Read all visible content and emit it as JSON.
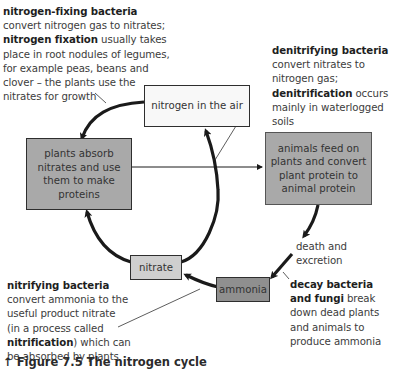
{
  "annotations": {
    "nitrogen_fixing": {
      "title": "nitrogen-fixing bacteria",
      "line1": "convert nitrogen gas to nitrates;",
      "term": "nitrogen fixation",
      "line2_rest": " usually takes",
      "line3": "place in root nodules of legumes,",
      "line4": "for example peas, beans and",
      "line5": "clover – the plants use the",
      "line6": "nitrates for growth"
    },
    "denitrifying": {
      "title": "denitrifying bacteria",
      "line1": "convert nitrates to",
      "line2": "nitrogen gas;",
      "term": "denitrification",
      "line3_rest": " occurs",
      "line4": "mainly in waterlogged",
      "line5": "soils"
    },
    "death": "death and excretion",
    "decay": {
      "title1": "decay bacteria",
      "title2": "and fungi",
      "line2_rest": " break",
      "line3": "down dead plants",
      "line4": "and animals to",
      "line5": "produce ammonia"
    },
    "nitrifying": {
      "title": "nitrifying bacteria",
      "line1": "convert ammonia to the",
      "line2": "useful product nitrate",
      "line3": "(in a process called",
      "term": "nitrification",
      "line4_rest": ") which can",
      "line5": "be absorbed by plants"
    }
  },
  "boxes": {
    "nitrogen_air": "nitrogen in the air",
    "plants": [
      "plants absorb",
      "nitrates and use",
      "them to make",
      "proteins"
    ],
    "animals": [
      "animals feed on",
      "plants and convert",
      "plant protein to",
      "animal protein"
    ],
    "nitrate": "nitrate",
    "ammonia": "ammonia"
  },
  "caption": {
    "icon": "↑",
    "text": "Figure 7.5 The nitrogen cycle"
  },
  "colors": {
    "box_grey": "#a9a9a9",
    "box_light": "#cfcfcf",
    "box_dark": "#8f8f8f",
    "arrow": "#1a1a1a"
  }
}
